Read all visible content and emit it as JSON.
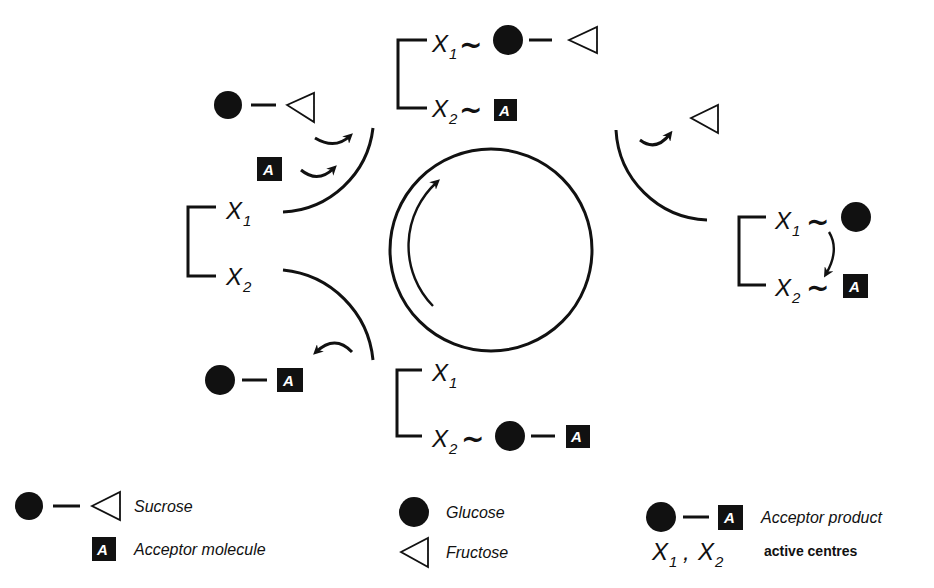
{
  "diagram": {
    "accent_color": "#111111",
    "background_color": "#ffffff",
    "labels": {
      "x": "X",
      "sub1": "1",
      "sub2": "2",
      "tilde": "~",
      "acceptor_letter": "A"
    },
    "nodes": {
      "top_complex": {
        "x1_bound": "glucose-fructose (sucrose)",
        "x2_bound": "acceptor"
      },
      "left_enzyme": {
        "x1_bound": "none",
        "x2_bound": "none"
      },
      "right_complex": {
        "x1_bound": "glucose",
        "x2_bound": "acceptor",
        "transfer": "X1 to X2"
      },
      "bottom_complex": {
        "x1_bound": "none",
        "x2_bound": "glucose-acceptor"
      },
      "inputs": [
        "sucrose",
        "acceptor"
      ],
      "outputs": [
        "fructose",
        "acceptor product"
      ]
    }
  },
  "legend": {
    "sucrose": "Sucrose",
    "acceptor_molecule": "Acceptor molecule",
    "glucose": "Glucose",
    "fructose": "Fructose",
    "acceptor_product": "Acceptor product",
    "active_centres_label": "active centres",
    "comma": ","
  }
}
